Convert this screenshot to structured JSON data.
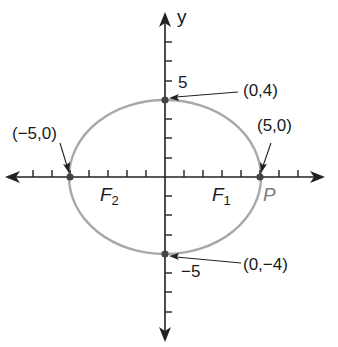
{
  "diagram": {
    "type": "ellipse-on-coordinate-axes",
    "axes": {
      "y_label": "y",
      "y_tick_positive": "5",
      "y_tick_negative": "−5"
    },
    "ellipse": {
      "equation_implied": "x^2/25 + y^2/16 = 1",
      "center": [
        0,
        0
      ],
      "semi_major": 5,
      "semi_minor": 4,
      "stroke_color": "#a8a8a8"
    },
    "points": [
      {
        "name": "top-vertex",
        "label": "(0,4)"
      },
      {
        "name": "left-vertex",
        "label": "(−5,0)"
      },
      {
        "name": "right-vertex",
        "label": "(5,0)"
      },
      {
        "name": "bottom-vertex",
        "label": "(0,−4)"
      }
    ],
    "foci": [
      {
        "name": "F2",
        "letter": "F",
        "sub": "2"
      },
      {
        "name": "F1",
        "letter": "F",
        "sub": "1"
      }
    ],
    "point_p": "P",
    "colors": {
      "axis": "#222222",
      "ellipse": "#a8a8a8",
      "point": "#444444",
      "text": "#1a1a1a",
      "p_label": "#7a7a7a"
    }
  }
}
